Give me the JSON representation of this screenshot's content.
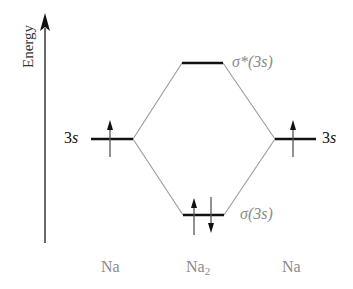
{
  "axis": {
    "label": "Energy",
    "direction": "up"
  },
  "atomic_orbitals": {
    "left": {
      "label_num": "3",
      "label_orb": "s",
      "electrons": [
        "up"
      ],
      "atom": "Na"
    },
    "right": {
      "label_num": "3",
      "label_orb": "s",
      "electrons": [
        "up"
      ],
      "atom": "Na"
    }
  },
  "molecular_orbitals": {
    "antibonding": {
      "label": "σ*(3s)",
      "electrons": []
    },
    "bonding": {
      "label": "σ(3s)",
      "electrons": [
        "up",
        "down"
      ]
    }
  },
  "bottom_labels": {
    "left": "Na",
    "center_base": "Na",
    "center_sub": "2",
    "right": "Na"
  },
  "colors": {
    "level": "#111111",
    "connector": "#9a9a9a",
    "axis": "#333333",
    "mo_label": "#8a8a8a"
  }
}
